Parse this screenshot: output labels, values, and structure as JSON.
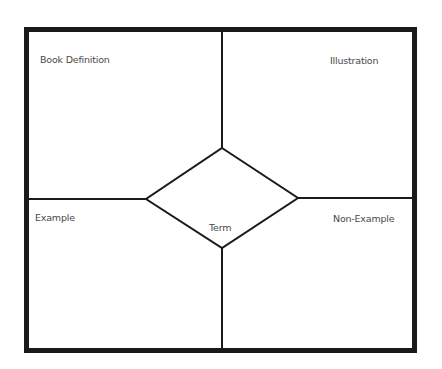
{
  "diagram": {
    "quadrants": {
      "top_left": "Book Definition",
      "top_right": "Illustration",
      "bottom_left": "Example",
      "bottom_right": "Non-Example"
    },
    "center": "Term"
  },
  "colors": {
    "line": "#1a1a1a",
    "text": "#4a4a4a",
    "background": "#ffffff"
  }
}
